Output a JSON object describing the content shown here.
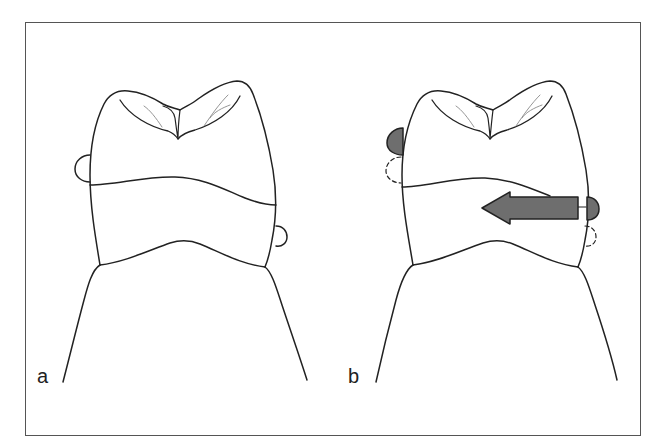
{
  "figure": {
    "panels": [
      {
        "id": "a",
        "label": "a",
        "description": "Tooth outline with two round contact points (one mesial, one distal), unshaded"
      },
      {
        "id": "b",
        "label": "b",
        "description": "Tooth outline with shaded contact points displaced from original positions (dashed circles) and a large leftward arrow indicating direction of movement"
      }
    ],
    "colors": {
      "line": "#222222",
      "fill_shaded": "#6e6e6e",
      "fine_line": "#8a8a8a",
      "frame": "#555555",
      "background": "#ffffff"
    },
    "arrow": {
      "direction": "left"
    }
  }
}
